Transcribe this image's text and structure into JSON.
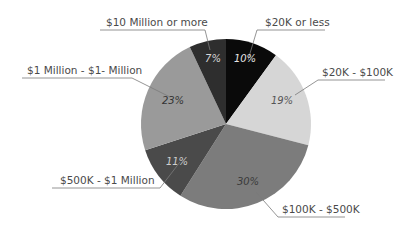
{
  "chart_data": {
    "type": "pie",
    "title": "",
    "start_angle_deg": 0,
    "direction": "clockwise",
    "categories": [
      "$20K or less",
      "$20K - $100K",
      "$100K - $500K",
      "$500K - $1 Million",
      "$1 Million - $1- Million",
      "$10 Million or more"
    ],
    "values": [
      10,
      19,
      30,
      11,
      23,
      7
    ],
    "value_labels": [
      "10%",
      "19%",
      "30%",
      "11%",
      "23%",
      "7%"
    ],
    "colors": [
      "#0a0a0a",
      "#d6d6d6",
      "#7c7c7c",
      "#4a4a4a",
      "#9a9a9a",
      "#2e2e2e"
    ],
    "label_colors": [
      "#e6e6e6",
      "#555555",
      "#3a3a3a",
      "#cfcfcf",
      "#333333",
      "#d8d8d8"
    ],
    "legend": "none (outside labels with leader lines)"
  },
  "labels": {
    "s0": "$20K or less",
    "s1": "$20K - $100K",
    "s2": "$100K - $500K",
    "s3": "$500K - $1 Million",
    "s4": "$1 Million - $1- Million",
    "s5": "$10 Million or more",
    "p0": "10%",
    "p1": "19%",
    "p2": "30%",
    "p3": "11%",
    "p4": "23%",
    "p5": "7%"
  }
}
